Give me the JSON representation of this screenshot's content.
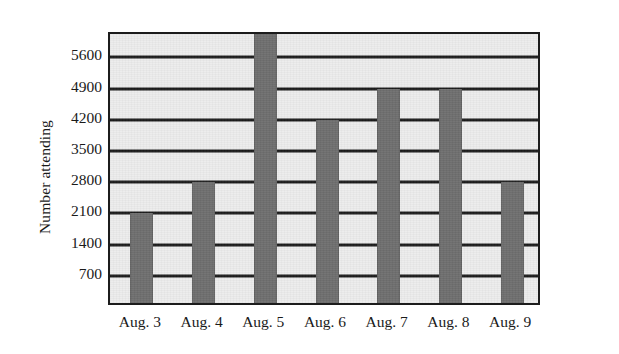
{
  "chart_data": {
    "type": "bar",
    "title": "",
    "subtitle": "",
    "xlabel": "",
    "ylabel": "Number attending",
    "categories": [
      "Aug. 3",
      "Aug. 4",
      "Aug. 5",
      "Aug. 6",
      "Aug. 7",
      "Aug. 8",
      "Aug. 9"
    ],
    "values": [
      2100,
      2800,
      6200,
      4200,
      4900,
      4900,
      2800
    ],
    "value_notes": {
      "Aug. 5": "bar extends past the top of the plot frame (above 5600); clipped"
    },
    "ylim": [
      0,
      6125
    ],
    "ytick_labels": [
      "5600",
      "4900",
      "4200",
      "3500",
      "2800",
      "2100",
      "1400",
      "700"
    ],
    "yticks": [
      5600,
      4900,
      4200,
      3500,
      2800,
      2100,
      1400,
      700
    ],
    "ytick_interval": 700,
    "grid": true,
    "grid_axis": "y",
    "legend": false,
    "legend_position": "none",
    "colors": {
      "bar": "#6e6e6e",
      "plot_background": "#ececec",
      "gridline": "#1c1c1c",
      "axis_border": "#1c1c1c",
      "text": "#1a1a1a",
      "page_background": "#ffffff"
    }
  }
}
